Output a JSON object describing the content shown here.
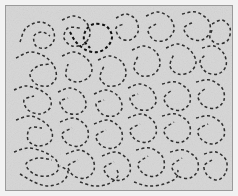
{
  "stimulus": {
    "title": "Contour Integration Stimulus",
    "type": "dashed-contour-field",
    "canvas": {
      "width": 238,
      "height": 196,
      "outer_background": "#f2f2f2",
      "panel_inset": 5,
      "panel_width": 228,
      "panel_height": 186,
      "panel_background": "#d6d6d6",
      "panel_border_color": "#9a9a9a",
      "panel_border_width": 1,
      "noise_enabled": true,
      "noise_opacity": 0.55
    },
    "element": {
      "style": "short dark line segments (dashes) placed along smooth curved paths",
      "dash_length": 3.0,
      "dash_gap": 2.6,
      "stroke_width": 1.5,
      "normal_color": "#2e2e2e",
      "highlight_color": "#111111",
      "highlight_stroke_width": 2.0
    },
    "counts": {
      "total_contours": 34,
      "highlighted_contours": 1
    },
    "contours": [
      {
        "id": "c01",
        "highlight": false,
        "points": [
          [
            14,
            36
          ],
          [
            20,
            22
          ],
          [
            34,
            16
          ],
          [
            46,
            22
          ],
          [
            48,
            34
          ],
          [
            40,
            42
          ],
          [
            30,
            40
          ],
          [
            28,
            30
          ],
          [
            36,
            26
          ],
          [
            44,
            30
          ]
        ]
      },
      {
        "id": "c02",
        "highlight": false,
        "points": [
          [
            56,
            14
          ],
          [
            68,
            10
          ],
          [
            80,
            16
          ],
          [
            84,
            28
          ],
          [
            78,
            38
          ],
          [
            66,
            40
          ],
          [
            58,
            32
          ],
          [
            62,
            22
          ],
          [
            74,
            22
          ]
        ]
      },
      {
        "id": "c03",
        "highlight": true,
        "points": [
          [
            64,
            26
          ],
          [
            70,
            36
          ],
          [
            80,
            44
          ],
          [
            92,
            46
          ],
          [
            102,
            40
          ],
          [
            106,
            30
          ],
          [
            100,
            20
          ],
          [
            88,
            18
          ],
          [
            80,
            24
          ],
          [
            78,
            34
          ],
          [
            84,
            42
          ]
        ]
      },
      {
        "id": "c04",
        "highlight": false,
        "points": [
          [
            110,
            12
          ],
          [
            120,
            8
          ],
          [
            130,
            14
          ],
          [
            132,
            26
          ],
          [
            124,
            34
          ],
          [
            114,
            32
          ],
          [
            110,
            22
          ],
          [
            118,
            18
          ]
        ]
      },
      {
        "id": "c05",
        "highlight": false,
        "points": [
          [
            140,
            10
          ],
          [
            152,
            6
          ],
          [
            164,
            12
          ],
          [
            168,
            24
          ],
          [
            160,
            34
          ],
          [
            148,
            34
          ],
          [
            142,
            24
          ],
          [
            150,
            18
          ]
        ]
      },
      {
        "id": "c06",
        "highlight": false,
        "points": [
          [
            176,
            8
          ],
          [
            190,
            6
          ],
          [
            202,
            14
          ],
          [
            204,
            26
          ],
          [
            196,
            34
          ],
          [
            184,
            32
          ],
          [
            178,
            22
          ],
          [
            188,
            16
          ]
        ]
      },
      {
        "id": "c07",
        "highlight": false,
        "points": [
          [
            206,
            18
          ],
          [
            216,
            14
          ],
          [
            224,
            22
          ],
          [
            222,
            34
          ],
          [
            212,
            38
          ],
          [
            204,
            32
          ],
          [
            206,
            24
          ]
        ]
      },
      {
        "id": "c08",
        "highlight": false,
        "points": [
          [
            10,
            52
          ],
          [
            24,
            46
          ],
          [
            38,
            50
          ],
          [
            48,
            60
          ],
          [
            50,
            72
          ],
          [
            42,
            80
          ],
          [
            30,
            78
          ],
          [
            24,
            68
          ],
          [
            32,
            60
          ],
          [
            44,
            58
          ]
        ]
      },
      {
        "id": "c09",
        "highlight": false,
        "points": [
          [
            56,
            50
          ],
          [
            68,
            46
          ],
          [
            80,
            52
          ],
          [
            86,
            62
          ],
          [
            82,
            72
          ],
          [
            70,
            76
          ],
          [
            60,
            70
          ],
          [
            62,
            58
          ]
        ]
      },
      {
        "id": "c10",
        "highlight": false,
        "points": [
          [
            92,
            54
          ],
          [
            104,
            50
          ],
          [
            116,
            56
          ],
          [
            120,
            68
          ],
          [
            114,
            78
          ],
          [
            102,
            80
          ],
          [
            94,
            72
          ],
          [
            98,
            60
          ]
        ]
      },
      {
        "id": "c11",
        "highlight": false,
        "points": [
          [
            126,
            44
          ],
          [
            138,
            40
          ],
          [
            150,
            46
          ],
          [
            154,
            58
          ],
          [
            148,
            68
          ],
          [
            136,
            70
          ],
          [
            128,
            62
          ],
          [
            132,
            50
          ]
        ]
      },
      {
        "id": "c12",
        "highlight": false,
        "points": [
          [
            160,
            42
          ],
          [
            172,
            38
          ],
          [
            184,
            44
          ],
          [
            190,
            56
          ],
          [
            184,
            66
          ],
          [
            172,
            68
          ],
          [
            164,
            60
          ],
          [
            168,
            48
          ]
        ]
      },
      {
        "id": "c13",
        "highlight": false,
        "points": [
          [
            196,
            42
          ],
          [
            208,
            40
          ],
          [
            218,
            48
          ],
          [
            220,
            60
          ],
          [
            212,
            68
          ],
          [
            200,
            66
          ],
          [
            194,
            56
          ],
          [
            200,
            48
          ]
        ]
      },
      {
        "id": "c14",
        "highlight": false,
        "points": [
          [
            8,
            84
          ],
          [
            20,
            80
          ],
          [
            34,
            84
          ],
          [
            44,
            92
          ],
          [
            44,
            102
          ],
          [
            34,
            108
          ],
          [
            22,
            104
          ],
          [
            18,
            94
          ],
          [
            28,
            90
          ]
        ]
      },
      {
        "id": "c15",
        "highlight": false,
        "points": [
          [
            52,
            86
          ],
          [
            64,
            82
          ],
          [
            76,
            88
          ],
          [
            80,
            100
          ],
          [
            72,
            108
          ],
          [
            60,
            106
          ],
          [
            54,
            96
          ],
          [
            62,
            92
          ]
        ]
      },
      {
        "id": "c16",
        "highlight": false,
        "points": [
          [
            88,
            88
          ],
          [
            100,
            84
          ],
          [
            112,
            90
          ],
          [
            116,
            102
          ],
          [
            108,
            110
          ],
          [
            96,
            108
          ],
          [
            90,
            98
          ],
          [
            98,
            94
          ]
        ]
      },
      {
        "id": "c17",
        "highlight": false,
        "points": [
          [
            122,
            82
          ],
          [
            134,
            78
          ],
          [
            146,
            84
          ],
          [
            150,
            96
          ],
          [
            142,
            104
          ],
          [
            130,
            102
          ],
          [
            124,
            92
          ],
          [
            132,
            88
          ]
        ]
      },
      {
        "id": "c18",
        "highlight": false,
        "points": [
          [
            156,
            78
          ],
          [
            170,
            76
          ],
          [
            182,
            84
          ],
          [
            184,
            96
          ],
          [
            176,
            104
          ],
          [
            164,
            102
          ],
          [
            158,
            92
          ],
          [
            166,
            84
          ]
        ]
      },
      {
        "id": "c19",
        "highlight": false,
        "points": [
          [
            190,
            76
          ],
          [
            204,
            74
          ],
          [
            216,
            82
          ],
          [
            218,
            94
          ],
          [
            210,
            102
          ],
          [
            198,
            100
          ],
          [
            192,
            90
          ],
          [
            200,
            82
          ]
        ]
      },
      {
        "id": "c20",
        "highlight": false,
        "points": [
          [
            10,
            114
          ],
          [
            24,
            110
          ],
          [
            38,
            116
          ],
          [
            46,
            126
          ],
          [
            44,
            136
          ],
          [
            32,
            140
          ],
          [
            22,
            134
          ],
          [
            24,
            122
          ],
          [
            36,
            122
          ]
        ]
      },
      {
        "id": "c21",
        "highlight": false,
        "points": [
          [
            54,
            116
          ],
          [
            68,
            112
          ],
          [
            80,
            120
          ],
          [
            82,
            132
          ],
          [
            74,
            140
          ],
          [
            62,
            138
          ],
          [
            56,
            128
          ],
          [
            66,
            122
          ]
        ]
      },
      {
        "id": "c22",
        "highlight": false,
        "points": [
          [
            88,
            118
          ],
          [
            102,
            114
          ],
          [
            114,
            122
          ],
          [
            116,
            134
          ],
          [
            108,
            142
          ],
          [
            96,
            140
          ],
          [
            90,
            130
          ],
          [
            100,
            124
          ]
        ]
      },
      {
        "id": "c23",
        "highlight": false,
        "points": [
          [
            122,
            112
          ],
          [
            136,
            108
          ],
          [
            148,
            116
          ],
          [
            150,
            128
          ],
          [
            142,
            136
          ],
          [
            130,
            134
          ],
          [
            124,
            124
          ],
          [
            134,
            118
          ]
        ]
      },
      {
        "id": "c24",
        "highlight": false,
        "points": [
          [
            156,
            110
          ],
          [
            170,
            108
          ],
          [
            182,
            116
          ],
          [
            184,
            128
          ],
          [
            176,
            136
          ],
          [
            164,
            134
          ],
          [
            158,
            124
          ],
          [
            168,
            116
          ]
        ]
      },
      {
        "id": "c25",
        "highlight": false,
        "points": [
          [
            190,
            112
          ],
          [
            204,
            110
          ],
          [
            216,
            118
          ],
          [
            218,
            130
          ],
          [
            208,
            138
          ],
          [
            196,
            134
          ],
          [
            192,
            124
          ],
          [
            202,
            118
          ]
        ]
      },
      {
        "id": "c26",
        "highlight": false,
        "points": [
          [
            8,
            146
          ],
          [
            22,
            142
          ],
          [
            38,
            146
          ],
          [
            50,
            154
          ],
          [
            52,
            164
          ],
          [
            42,
            170
          ],
          [
            28,
            168
          ],
          [
            20,
            158
          ],
          [
            32,
            152
          ],
          [
            46,
            154
          ]
        ]
      },
      {
        "id": "c27",
        "highlight": false,
        "points": [
          [
            60,
            148
          ],
          [
            74,
            144
          ],
          [
            86,
            152
          ],
          [
            88,
            164
          ],
          [
            80,
            172
          ],
          [
            68,
            170
          ],
          [
            62,
            160
          ],
          [
            72,
            154
          ]
        ]
      },
      {
        "id": "c28",
        "highlight": false,
        "points": [
          [
            96,
            150
          ],
          [
            110,
            146
          ],
          [
            122,
            154
          ],
          [
            124,
            166
          ],
          [
            116,
            174
          ],
          [
            104,
            172
          ],
          [
            98,
            162
          ],
          [
            108,
            156
          ]
        ]
      },
      {
        "id": "c29",
        "highlight": false,
        "points": [
          [
            130,
            144
          ],
          [
            144,
            142
          ],
          [
            156,
            150
          ],
          [
            158,
            162
          ],
          [
            150,
            170
          ],
          [
            138,
            168
          ],
          [
            132,
            158
          ],
          [
            142,
            150
          ]
        ]
      },
      {
        "id": "c30",
        "highlight": false,
        "points": [
          [
            164,
            146
          ],
          [
            178,
            144
          ],
          [
            190,
            152
          ],
          [
            192,
            164
          ],
          [
            184,
            172
          ],
          [
            172,
            170
          ],
          [
            166,
            160
          ],
          [
            176,
            152
          ]
        ]
      },
      {
        "id": "c31",
        "highlight": false,
        "points": [
          [
            198,
            148
          ],
          [
            210,
            146
          ],
          [
            220,
            154
          ],
          [
            220,
            166
          ],
          [
            212,
            174
          ],
          [
            202,
            170
          ],
          [
            198,
            160
          ],
          [
            206,
            154
          ]
        ]
      },
      {
        "id": "c32",
        "highlight": false,
        "points": [
          [
            14,
            168
          ],
          [
            28,
            176
          ],
          [
            42,
            180
          ],
          [
            56,
            176
          ],
          [
            62,
            166
          ],
          [
            54,
            160
          ]
        ]
      },
      {
        "id": "c33",
        "highlight": false,
        "points": [
          [
            74,
            176
          ],
          [
            88,
            180
          ],
          [
            102,
            178
          ],
          [
            112,
            170
          ],
          [
            110,
            162
          ]
        ]
      },
      {
        "id": "c34",
        "highlight": false,
        "points": [
          [
            128,
            176
          ],
          [
            142,
            180
          ],
          [
            158,
            178
          ],
          [
            170,
            172
          ],
          [
            172,
            164
          ]
        ]
      }
    ]
  }
}
